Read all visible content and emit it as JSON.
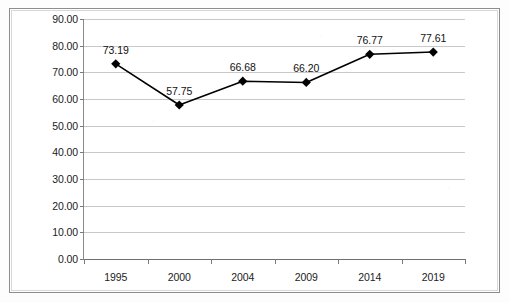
{
  "chart_data": {
    "type": "line",
    "title": "",
    "xlabel": "",
    "ylabel": "",
    "categories": [
      "1995",
      "2000",
      "2004",
      "2009",
      "2014",
      "2019"
    ],
    "values": [
      73.19,
      57.75,
      66.68,
      66.2,
      76.77,
      77.61
    ],
    "point_labels": [
      "73.19",
      "57.75",
      "66.68",
      "66.20",
      "76.77",
      "77.61"
    ],
    "ylim": [
      0,
      90
    ],
    "ytick_step": 10,
    "ytick_labels": [
      "0.00",
      "10.00",
      "20.00",
      "30.00",
      "40.00",
      "50.00",
      "60.00",
      "70.00",
      "80.00",
      "90.00"
    ],
    "grid": true,
    "legend": "none",
    "series": [
      {
        "name": "",
        "values": [
          73.19,
          57.75,
          66.68,
          66.2,
          76.77,
          77.61
        ],
        "marker": "diamond",
        "line_color": "#000000",
        "marker_color": "#000000"
      }
    ],
    "colors": {
      "line": "#000000",
      "marker": "#000000",
      "gridline": "#c9c9c9",
      "axis": "#7a7a7a",
      "text": "#111111",
      "frame": "#8d8d8d",
      "background": "#ffffff"
    }
  }
}
